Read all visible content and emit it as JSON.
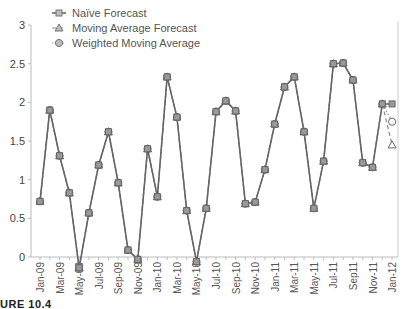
{
  "caption": "URE 10.4",
  "chart_data": {
    "type": "line",
    "title": "",
    "xlabel": "",
    "ylabel": "",
    "ylim": [
      0,
      3
    ],
    "yticks": [
      0,
      0.5,
      1,
      1.5,
      2,
      2.5,
      3
    ],
    "ytick_labels": [
      "0",
      "0.5",
      "1",
      "1.5",
      "2",
      "2.5",
      "3"
    ],
    "grid": false,
    "legend_position": "top-left",
    "x_tick_labels": [
      "Jan-09",
      "Mar-09",
      "May-09",
      "Jul-09",
      "Sep-09",
      "Nov-09",
      "Jan-10",
      "Mar-10",
      "May-10",
      "Jul-10",
      "Sep-10",
      "Nov-10",
      "Jan-11",
      "Mar-11",
      "May-11",
      "Jul-11",
      "Sep11",
      "Nov-11",
      "Jan-12"
    ],
    "x": [
      "Jan-09",
      "Feb-09",
      "Mar-09",
      "Apr-09",
      "May-09",
      "Jun-09",
      "Jul-09",
      "Aug-09",
      "Sep-09",
      "Oct-09",
      "Nov-09",
      "Dec-09",
      "Jan-10",
      "Feb-10",
      "Mar-10",
      "Apr-10",
      "May-10",
      "Jun-10",
      "Jul-10",
      "Aug-10",
      "Sep-10",
      "Oct-10",
      "Nov-10",
      "Dec-10",
      "Jan-11",
      "Feb-11",
      "Mar-11",
      "Apr-11",
      "May-11",
      "Jun-11",
      "Jul-11",
      "Aug-11",
      "Sep-11",
      "Oct-11",
      "Nov-11",
      "Dec-11",
      "Jan-12"
    ],
    "series": [
      {
        "name": "Naïve Forecast",
        "marker": "square",
        "line": "solid",
        "values": [
          0.72,
          1.9,
          1.31,
          0.83,
          -0.14,
          0.57,
          1.19,
          1.62,
          0.96,
          0.09,
          -0.03,
          1.4,
          0.78,
          2.33,
          1.81,
          0.6,
          -0.06,
          0.63,
          1.88,
          2.02,
          1.89,
          0.69,
          0.71,
          1.13,
          1.72,
          2.2,
          2.33,
          1.62,
          0.63,
          1.24,
          2.5,
          2.51,
          2.29,
          1.22,
          1.16,
          1.98,
          1.98
        ]
      },
      {
        "name": "Moving Average Forecast",
        "marker": "triangle",
        "line": "dashed",
        "values": [
          0.72,
          1.9,
          1.31,
          0.83,
          -0.14,
          0.57,
          1.19,
          1.62,
          0.96,
          0.09,
          -0.03,
          1.4,
          0.78,
          2.33,
          1.81,
          0.6,
          -0.06,
          0.63,
          1.88,
          2.02,
          1.89,
          0.69,
          0.71,
          1.13,
          1.72,
          2.2,
          2.33,
          1.62,
          0.63,
          1.24,
          2.5,
          2.51,
          2.29,
          1.22,
          1.16,
          1.98,
          1.45
        ]
      },
      {
        "name": "Weighted Moving Average",
        "marker": "circle",
        "line": "dotted",
        "values": [
          0.72,
          1.9,
          1.31,
          0.83,
          -0.14,
          0.57,
          1.19,
          1.62,
          0.96,
          0.09,
          -0.03,
          1.4,
          0.78,
          2.33,
          1.81,
          0.6,
          -0.06,
          0.63,
          1.88,
          2.02,
          1.89,
          0.69,
          0.71,
          1.13,
          1.72,
          2.2,
          2.33,
          1.62,
          0.63,
          1.24,
          2.5,
          2.51,
          2.29,
          1.22,
          1.16,
          1.98,
          1.75
        ]
      }
    ]
  }
}
